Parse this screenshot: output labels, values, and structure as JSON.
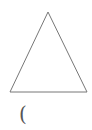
{
  "diagram": {
    "shape": "triangle",
    "stroke_color": "#777777",
    "fill_color": "#ffffff",
    "vertices": {
      "apex": [
        48,
        12
      ],
      "bottom_left": [
        10,
        92
      ],
      "bottom_right": [
        87,
        92
      ]
    }
  },
  "label": {
    "text": "("
  }
}
